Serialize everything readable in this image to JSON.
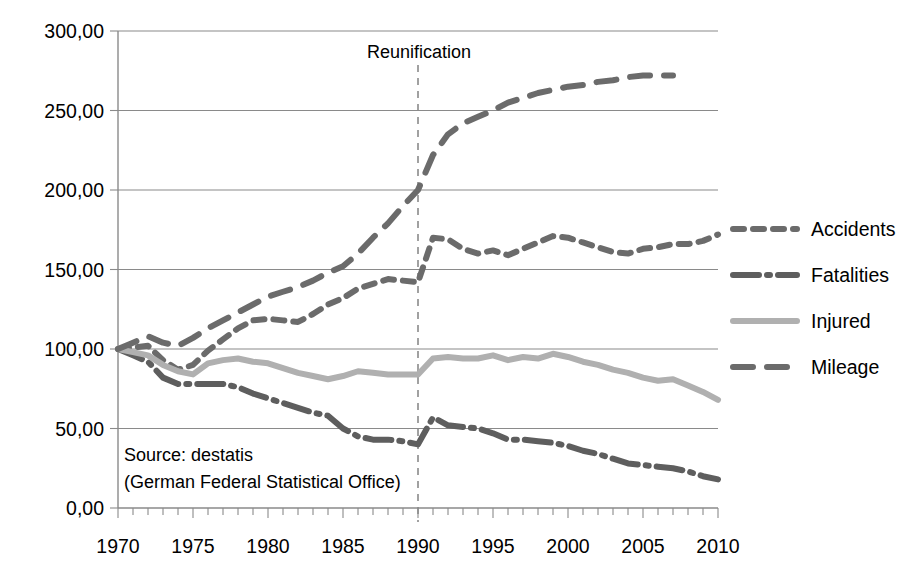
{
  "chart_data": {
    "type": "line",
    "title": "",
    "xlabel": "",
    "ylabel": "",
    "xlim": [
      1970,
      2010
    ],
    "ylim": [
      0,
      300
    ],
    "grid": true,
    "legend_position": "right",
    "y_ticks": [
      "0,00",
      "50,00",
      "100,00",
      "150,00",
      "200,00",
      "250,00",
      "300,00"
    ],
    "y_tick_values": [
      0,
      50,
      100,
      150,
      200,
      250,
      300
    ],
    "x_ticks": [
      "1970",
      "1975",
      "1980",
      "1985",
      "1990",
      "1995",
      "2000",
      "2005",
      "2010"
    ],
    "x_tick_values": [
      1970,
      1975,
      1980,
      1985,
      1990,
      1995,
      2000,
      2005,
      2010
    ],
    "x_minor_tick_step": 1,
    "annotations": [
      {
        "name": "reunification",
        "text": "Reunification",
        "x": 1990,
        "kind": "vertical-line-label"
      },
      {
        "name": "source-line-1",
        "text": "Source: destatis",
        "kind": "text"
      },
      {
        "name": "source-line-2",
        "text": "(German Federal Statistical Office)",
        "kind": "text"
      }
    ],
    "series": [
      {
        "name": "Accidents",
        "color": "#6b6b6b",
        "style": "dashed-short",
        "dasharray": "11 9",
        "width": 6,
        "x": [
          1970,
          1971,
          1972,
          1973,
          1974,
          1975,
          1976,
          1977,
          1978,
          1979,
          1980,
          1981,
          1982,
          1983,
          1984,
          1985,
          1986,
          1987,
          1988,
          1989,
          1990,
          1991,
          1992,
          1993,
          1994,
          1995,
          1996,
          1997,
          1998,
          1999,
          2000,
          2001,
          2002,
          2003,
          2004,
          2005,
          2006,
          2007,
          2008,
          2009,
          2010
        ],
        "values": [
          100,
          101,
          102,
          93,
          87,
          90,
          99,
          106,
          113,
          118,
          119,
          118,
          117,
          122,
          128,
          132,
          138,
          141,
          144,
          143,
          142,
          170,
          169,
          163,
          160,
          162,
          159,
          163,
          167,
          171,
          170,
          167,
          164,
          161,
          160,
          163,
          164,
          166,
          166,
          168,
          172
        ]
      },
      {
        "name": "Fatalities",
        "color": "#5e5e5e",
        "style": "long-dash-dot",
        "dasharray": "26 8 3 8",
        "width": 6,
        "x": [
          1970,
          1971,
          1972,
          1973,
          1974,
          1975,
          1976,
          1977,
          1978,
          1979,
          1980,
          1981,
          1982,
          1983,
          1984,
          1985,
          1986,
          1987,
          1988,
          1989,
          1990,
          1991,
          1992,
          1993,
          1994,
          1995,
          1996,
          1997,
          1998,
          1999,
          2000,
          2001,
          2002,
          2003,
          2004,
          2005,
          2006,
          2007,
          2008,
          2009,
          2010
        ],
        "values": [
          100,
          96,
          92,
          82,
          78,
          78,
          78,
          78,
          76,
          72,
          69,
          66,
          63,
          60,
          58,
          50,
          45,
          43,
          43,
          42,
          40,
          57,
          52,
          51,
          50,
          47,
          43,
          43,
          42,
          41,
          39,
          36,
          34,
          31,
          28,
          27,
          26,
          25,
          23,
          20,
          18
        ]
      },
      {
        "name": "Injured",
        "color": "#b0b0b0",
        "style": "solid",
        "dasharray": "",
        "width": 6,
        "x": [
          1970,
          1971,
          1972,
          1973,
          1974,
          1975,
          1976,
          1977,
          1978,
          1979,
          1980,
          1981,
          1982,
          1983,
          1984,
          1985,
          1986,
          1987,
          1988,
          1989,
          1990,
          1991,
          1992,
          1993,
          1994,
          1995,
          1996,
          1997,
          1998,
          1999,
          2000,
          2001,
          2002,
          2003,
          2004,
          2005,
          2006,
          2007,
          2008,
          2009,
          2010
        ],
        "values": [
          100,
          98,
          96,
          90,
          86,
          84,
          91,
          93,
          94,
          92,
          91,
          88,
          85,
          83,
          81,
          83,
          86,
          85,
          84,
          84,
          84,
          94,
          95,
          94,
          94,
          96,
          93,
          95,
          94,
          97,
          95,
          92,
          90,
          87,
          85,
          82,
          80,
          81,
          77,
          73,
          68
        ]
      },
      {
        "name": "Mileage",
        "color": "#6b6b6b",
        "style": "dashed-medium",
        "dasharray": "20 14",
        "width": 6,
        "x": [
          1970,
          1971,
          1972,
          1973,
          1974,
          1975,
          1976,
          1977,
          1978,
          1979,
          1980,
          1981,
          1982,
          1983,
          1984,
          1985,
          1986,
          1987,
          1988,
          1989,
          1990,
          1991,
          1992,
          1993,
          1994,
          1995,
          1996,
          1997,
          1998,
          1999,
          2000,
          2001,
          2002,
          2003,
          2004,
          2005,
          2006,
          2007
        ],
        "values": [
          100,
          104,
          108,
          104,
          102,
          107,
          113,
          118,
          123,
          128,
          133,
          136,
          139,
          143,
          148,
          152,
          160,
          170,
          179,
          190,
          200,
          222,
          235,
          242,
          246,
          250,
          255,
          258,
          261,
          263,
          265,
          266,
          268,
          269,
          271,
          272,
          272,
          272
        ]
      }
    ]
  },
  "legend": {
    "items": [
      {
        "label": "Accidents"
      },
      {
        "label": "Fatalities"
      },
      {
        "label": "Injured"
      },
      {
        "label": "Mileage"
      }
    ]
  }
}
